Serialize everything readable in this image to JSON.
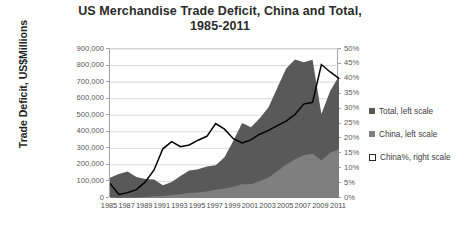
{
  "chart_data": {
    "type": "area",
    "title": "US Merchandise Trade Deficit, China and Total, 1985-2011",
    "title_line1": "US Merchandise Trade Deficit, China and Total,",
    "title_line2": "1985-2011",
    "xlabel": "",
    "ylabel": "Trade Deficit, US$Millions",
    "y2label": "",
    "grid": true,
    "legend_position": "right",
    "ylim": [
      0,
      900000
    ],
    "y2lim": [
      0,
      0.5
    ],
    "yticks": [
      "0",
      "100,000",
      "200,000",
      "300,000",
      "400,000",
      "500,000",
      "600,000",
      "700,000",
      "800,000",
      "900,000"
    ],
    "ytick_values": [
      0,
      100000,
      200000,
      300000,
      400000,
      500000,
      600000,
      700000,
      800000,
      900000
    ],
    "y2ticks": [
      "0%",
      "5%",
      "10%",
      "15%",
      "20%",
      "25%",
      "30%",
      "35%",
      "40%",
      "45%",
      "50%"
    ],
    "y2tick_values": [
      0,
      0.05,
      0.1,
      0.15,
      0.2,
      0.25,
      0.3,
      0.35,
      0.4,
      0.45,
      0.5
    ],
    "x": [
      1985,
      1986,
      1987,
      1988,
      1989,
      1990,
      1991,
      1992,
      1993,
      1994,
      1995,
      1996,
      1997,
      1998,
      1999,
      2000,
      2001,
      2002,
      2003,
      2004,
      2005,
      2006,
      2007,
      2008,
      2009,
      2010,
      2011
    ],
    "xtick_labels": [
      "1985",
      "1987",
      "1989",
      "1991",
      "1993",
      "1995",
      "1997",
      "1999",
      "2001",
      "2003",
      "2005",
      "2007",
      "2009",
      "2011"
    ],
    "xtick_values": [
      1985,
      1987,
      1989,
      1991,
      1993,
      1995,
      1997,
      1999,
      2001,
      2003,
      2005,
      2007,
      2009,
      2011
    ],
    "series": [
      {
        "name": "Total, left scale",
        "axis": "left",
        "kind": "area",
        "color": "#595959",
        "values": [
          122170,
          145081,
          159557,
          126959,
          115245,
          111037,
          76937,
          96897,
          132451,
          165831,
          174170,
          191000,
          198428,
          246687,
          346000,
          452400,
          427200,
          482300,
          547600,
          665400,
          782700,
          836000,
          819400,
          834700,
          506900,
          645900,
          737000
        ]
      },
      {
        "name": "China, left scale",
        "axis": "left",
        "kind": "area",
        "color": "#7f7f7f",
        "values": [
          6000,
          1700,
          2800,
          3500,
          6200,
          10400,
          12700,
          18300,
          22800,
          29500,
          33800,
          39500,
          49700,
          56900,
          68700,
          83800,
          83100,
          103100,
          124100,
          162000,
          202300,
          234100,
          258500,
          268000,
          226900,
          273100,
          295500
        ]
      },
      {
        "name": "China%, right scale",
        "axis": "right",
        "kind": "line",
        "color": "#000000",
        "values": [
          0.049,
          0.012,
          0.018,
          0.028,
          0.054,
          0.094,
          0.165,
          0.189,
          0.172,
          0.178,
          0.194,
          0.207,
          0.25,
          0.231,
          0.199,
          0.185,
          0.195,
          0.214,
          0.227,
          0.243,
          0.258,
          0.28,
          0.315,
          0.321,
          0.448,
          0.423,
          0.401
        ]
      }
    ]
  },
  "legend": {
    "items": [
      {
        "label": "Total, left scale",
        "marker": "filled-dark"
      },
      {
        "label": "China, left scale",
        "marker": "filled-mid"
      },
      {
        "label": "China%, right scale",
        "marker": "outline"
      }
    ]
  },
  "colors": {
    "total_area": "#595959",
    "china_area": "#7f7f7f",
    "china_pct_line": "#000000",
    "gridline": "#d9d9d9",
    "axis": "#808080",
    "text": "#3a3a3a"
  }
}
